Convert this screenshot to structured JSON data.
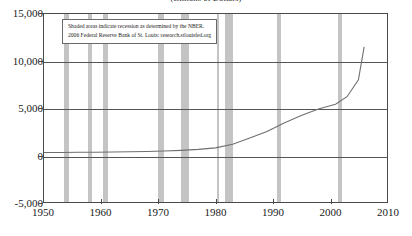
{
  "chart_data": {
    "type": "line",
    "title": "",
    "subtitle": "(Billions of Dollars)",
    "xlabel": "",
    "ylabel": "",
    "xlim": [
      1950,
      2010
    ],
    "ylim": [
      -5000,
      15000
    ],
    "grid": true,
    "legend": "none",
    "x_ticks": [
      "1950",
      "1960",
      "1970",
      "1980",
      "1990",
      "2000",
      "2010"
    ],
    "x_tick_values": [
      1950,
      1960,
      1970,
      1980,
      1990,
      2000,
      2010
    ],
    "y_ticks": [
      "-5,000",
      "0",
      "5,000",
      "10,000",
      "15,000"
    ],
    "y_tick_values": [
      -5000,
      0,
      5000,
      10000,
      15000
    ],
    "series": [
      {
        "name": "value",
        "x": [
          1950,
          1953,
          1956,
          1959,
          1962,
          1965,
          1968,
          1971,
          1974,
          1977,
          1980,
          1983,
          1986,
          1989,
          1992,
          1995,
          1998,
          2001,
          2003,
          2005,
          2006
        ],
        "values": [
          260,
          270,
          285,
          300,
          320,
          340,
          370,
          420,
          490,
          600,
          760,
          1150,
          1800,
          2500,
          3400,
          4200,
          4900,
          5400,
          6200,
          8000,
          11500
        ]
      }
    ],
    "shaded_regions": {
      "label": "recession",
      "color": "#c4c4c4",
      "spans": [
        [
          1953.5,
          1954.4
        ],
        [
          1957.6,
          1958.4
        ],
        [
          1960.3,
          1961.1
        ],
        [
          1969.9,
          1970.8
        ],
        [
          1973.9,
          1975.2
        ],
        [
          1980.0,
          1980.5
        ],
        [
          1981.5,
          1982.9
        ],
        [
          1990.5,
          1991.2
        ],
        [
          2001.2,
          2001.9
        ]
      ]
    },
    "annotation": {
      "line1": "Shaded areas indicate recession as determined by the NBER.",
      "line2": "2006 Federal Reserve Bank of St. Louis: research.stlouisfed.org"
    }
  }
}
